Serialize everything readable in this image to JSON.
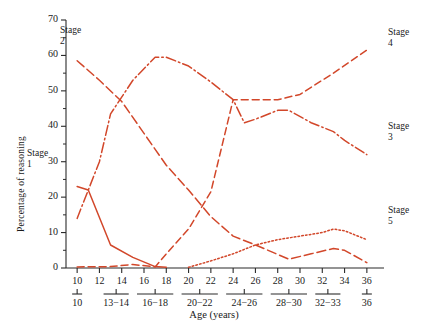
{
  "figure": {
    "background": "#ffffff",
    "line_color": "#d2472a",
    "axis_color": "#2b2b2b"
  },
  "chart_data": {
    "type": "line",
    "title": "",
    "xlabel": "Age (years)",
    "ylabel": "Percentage of reasoning",
    "xlim": [
      9,
      37
    ],
    "ylim": [
      0,
      70
    ],
    "grid": false,
    "legend_position": "inline-end-labels",
    "x_tick_labels": [
      "10",
      "12",
      "14",
      "16",
      "18",
      "20",
      "22",
      "24",
      "26",
      "28",
      "30",
      "32",
      "34",
      "36"
    ],
    "x_tick_values": [
      10,
      12,
      14,
      16,
      18,
      20,
      22,
      24,
      26,
      28,
      30,
      32,
      34,
      36
    ],
    "x_group_labels": [
      "10",
      "13−14",
      "16−18",
      "20−22",
      "24−26",
      "28−30",
      "32−33",
      "36"
    ],
    "x_group_centers": [
      10,
      13.5,
      17,
      21,
      25,
      29,
      32.5,
      36
    ],
    "x_group_spans": [
      [
        10,
        10
      ],
      [
        13,
        14
      ],
      [
        16,
        18
      ],
      [
        20,
        22
      ],
      [
        24,
        26
      ],
      [
        28,
        30
      ],
      [
        32,
        33
      ],
      [
        36,
        36
      ]
    ],
    "y_tick_labels": [
      "0",
      "10",
      "20",
      "30",
      "40",
      "50",
      "60",
      "70"
    ],
    "y_tick_values": [
      0,
      10,
      20,
      30,
      40,
      50,
      60,
      70
    ],
    "y_minor_tick_values": [
      5,
      15,
      25,
      35,
      45,
      55,
      65
    ],
    "series": [
      {
        "name": "Stage 1",
        "label": "Stage\n1",
        "dash": "solid",
        "x": [
          10,
          11,
          13,
          15,
          17,
          18
        ],
        "values": [
          23.0,
          22.0,
          6.5,
          3.0,
          0.4,
          0.2
        ]
      },
      {
        "name": "Stage 2",
        "label": "Stage\n2",
        "dash": "longdash",
        "x": [
          10,
          12,
          14,
          16,
          18,
          20,
          22,
          24,
          26,
          29,
          31,
          33,
          34,
          36
        ],
        "values": [
          58.5,
          53.0,
          47.0,
          38.0,
          29.0,
          22.0,
          14.5,
          9.0,
          6.5,
          2.5,
          4.0,
          5.5,
          5.0,
          1.5
        ]
      },
      {
        "name": "Stage 3",
        "label": "Stage\n3",
        "dash": "dashdot",
        "x": [
          10,
          12,
          13,
          15,
          17,
          18,
          20,
          22,
          24,
          25,
          26,
          28,
          29,
          31,
          33,
          34,
          36
        ],
        "values": [
          14.0,
          30.0,
          43.5,
          53.0,
          59.5,
          59.5,
          57.0,
          52.5,
          47.5,
          41.0,
          42.0,
          44.5,
          44.5,
          41.0,
          38.5,
          36.0,
          32.0
        ]
      },
      {
        "name": "Stage 4",
        "label": "Stage\n4",
        "dash": "dashed",
        "x": [
          10,
          13,
          15,
          17,
          18,
          20,
          22,
          24,
          26,
          28,
          30,
          33,
          36
        ],
        "values": [
          0.3,
          0.4,
          1.0,
          0.3,
          4.0,
          11.0,
          21.5,
          47.5,
          47.5,
          47.5,
          49.0,
          55.0,
          61.5
        ]
      },
      {
        "name": "Stage 5",
        "label": "Stage\n5",
        "dash": "dotted",
        "x": [
          20,
          22,
          24,
          26,
          28,
          30,
          32,
          33,
          34,
          36
        ],
        "values": [
          0.2,
          2.0,
          4.0,
          6.5,
          8.0,
          9.0,
          10.0,
          11.0,
          10.5,
          8.0
        ]
      }
    ],
    "inline_labels": [
      {
        "text_line1": "Stage",
        "text_line2": "2",
        "x_px": 60,
        "y_px": 25
      },
      {
        "text_line1": "Stage",
        "text_line2": "1",
        "x_px": 27,
        "y_px": 148
      },
      {
        "text_line1": "Stage",
        "text_line2": "4",
        "x_px": 388,
        "y_px": 27
      },
      {
        "text_line1": "Stage",
        "text_line2": "3",
        "x_px": 388,
        "y_px": 121
      },
      {
        "text_line1": "Stage",
        "text_line2": "5",
        "x_px": 388,
        "y_px": 205
      }
    ]
  }
}
